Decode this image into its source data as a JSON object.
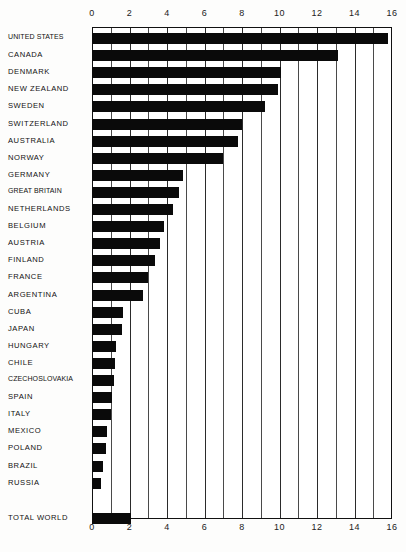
{
  "chart_data": {
    "type": "bar",
    "orientation": "horizontal",
    "title": "",
    "xlabel": "",
    "ylabel": "",
    "xlim": [
      0,
      16
    ],
    "xticks": [
      0,
      1,
      2,
      3,
      4,
      5,
      6,
      7,
      8,
      9,
      10,
      11,
      12,
      13,
      14,
      15,
      16
    ],
    "xtick_labels": [
      "0",
      "2",
      "4",
      "6",
      "8",
      "10",
      "12",
      "14",
      "16"
    ],
    "xtick_label_values": [
      0,
      2,
      4,
      6,
      8,
      10,
      12,
      14,
      16
    ],
    "grid": true,
    "legend": false,
    "bar_color": "#0a0a0a",
    "axis_color": "#2b2b2b",
    "categories": [
      "UNITED STATES",
      "CANADA",
      "DENMARK",
      "NEW ZEALAND",
      "SWEDEN",
      "SWITZERLAND",
      "AUSTRALIA",
      "NORWAY",
      "GERMANY",
      "GREAT BRITAIN",
      "NETHERLANDS",
      "BELGIUM",
      "AUSTRIA",
      "FINLAND",
      "FRANCE",
      "ARGENTINA",
      "CUBA",
      "JAPAN",
      "HUNGARY",
      "CHILE",
      "CZECHOSLOVAKIA",
      "SPAIN",
      "ITALY",
      "MEXICO",
      "POLAND",
      "BRAZIL",
      "RUSSIA",
      "TOTAL WORLD"
    ],
    "values": [
      15.8,
      13.1,
      10.1,
      9.9,
      9.2,
      8.0,
      7.8,
      7.0,
      4.85,
      4.65,
      4.3,
      3.85,
      3.6,
      3.35,
      3.0,
      2.7,
      1.65,
      1.6,
      1.3,
      1.2,
      1.15,
      1.05,
      1.0,
      0.8,
      0.75,
      0.6,
      0.5,
      2.1
    ],
    "separated_last_category": true
  }
}
